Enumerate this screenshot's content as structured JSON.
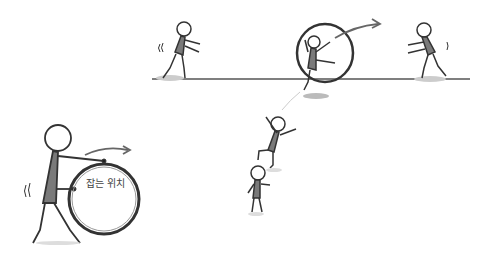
{
  "illustration": {
    "description": "Stick figures rolling and catching a hoop",
    "colors": {
      "line": "#333333",
      "body_fill": "#7a7a7a",
      "ground": "#555555",
      "shadow": "#bbbbbb",
      "arrow": "#666666"
    },
    "labels": {
      "grip_position": "잡는 위치"
    }
  }
}
